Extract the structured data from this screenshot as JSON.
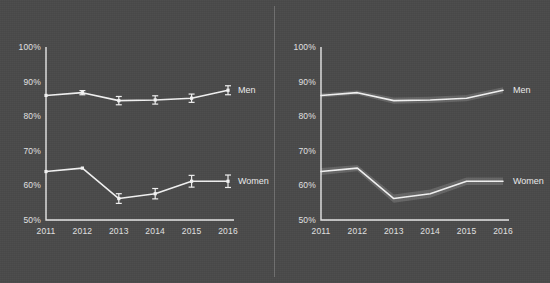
{
  "figure": {
    "background_color": "#4a4a4a",
    "ink_color": "#f2f2f2",
    "panel_divider": "vertical-rule"
  },
  "chart_data": [
    {
      "type": "line",
      "panel": "left",
      "title": "",
      "subtitle": "",
      "xlabel": "",
      "ylabel": "",
      "categories": [
        "2011",
        "2012",
        "2013",
        "2014",
        "2015",
        "2016"
      ],
      "x": [
        2011,
        2012,
        2013,
        2014,
        2015,
        2016
      ],
      "ylim": [
        50,
        100
      ],
      "yticks": [
        50,
        60,
        70,
        80,
        90,
        100
      ],
      "ytick_labels": [
        "50%",
        "60%",
        "70%",
        "80%",
        "90%",
        "100%"
      ],
      "xtick_labels": [
        "2011",
        "2012",
        "2013",
        "2014",
        "2015",
        "2016"
      ],
      "grid": false,
      "legend_position": "right-inline",
      "markers": true,
      "error_bars": true,
      "series": [
        {
          "name": "Men",
          "label": "Men",
          "values": [
            86.0,
            86.8,
            84.5,
            84.7,
            85.2,
            87.5
          ],
          "err_low": [
            86.0,
            86.2,
            83.3,
            83.5,
            84.0,
            86.2
          ],
          "err_high": [
            86.0,
            87.4,
            85.7,
            85.9,
            86.4,
            88.8
          ]
        },
        {
          "name": "Women",
          "label": "Women",
          "values": [
            64.0,
            65.0,
            56.2,
            57.6,
            61.2,
            61.2
          ],
          "err_low": [
            64.0,
            65.0,
            54.8,
            56.1,
            59.5,
            59.4
          ],
          "err_high": [
            64.0,
            65.0,
            57.6,
            59.1,
            62.9,
            63.0
          ]
        }
      ]
    },
    {
      "type": "line",
      "panel": "right",
      "title": "",
      "subtitle": "",
      "xlabel": "",
      "ylabel": "",
      "categories": [
        "2011",
        "2012",
        "2013",
        "2014",
        "2015",
        "2016"
      ],
      "x": [
        2011,
        2012,
        2013,
        2014,
        2015,
        2016
      ],
      "ylim": [
        50,
        100
      ],
      "yticks": [
        50,
        60,
        70,
        80,
        90,
        100
      ],
      "ytick_labels": [
        "50%",
        "60%",
        "70%",
        "80%",
        "90%",
        "100%"
      ],
      "xtick_labels": [
        "2011",
        "2012",
        "2013",
        "2014",
        "2015",
        "2016"
      ],
      "grid": false,
      "legend_position": "right-inline",
      "markers": false,
      "error_bars": false,
      "confidence_band": true,
      "series": [
        {
          "name": "Men",
          "label": "Men",
          "values": [
            86.0,
            86.8,
            84.5,
            84.7,
            85.2,
            87.5
          ],
          "band_low": [
            85.4,
            86.2,
            83.6,
            83.8,
            84.3,
            86.6
          ],
          "band_high": [
            86.6,
            87.4,
            85.4,
            85.6,
            86.1,
            88.4
          ]
        },
        {
          "name": "Women",
          "label": "Women",
          "values": [
            64.0,
            65.0,
            56.2,
            57.6,
            61.2,
            61.2
          ],
          "band_low": [
            63.0,
            64.1,
            55.0,
            56.4,
            60.1,
            60.1
          ],
          "band_high": [
            65.0,
            65.9,
            57.4,
            58.8,
            62.3,
            62.3
          ]
        }
      ]
    }
  ]
}
